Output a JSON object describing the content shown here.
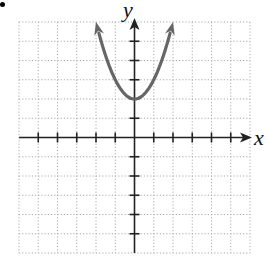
{
  "chart_data": {
    "type": "line",
    "title": "",
    "xlabel": "x",
    "ylabel": "y",
    "xlim": [
      -6,
      6
    ],
    "ylim": [
      -6,
      6
    ],
    "grid": true,
    "grid_style": "dotted",
    "x_ticks": [
      -5,
      -4,
      -3,
      -2,
      -1,
      1,
      2,
      3,
      4,
      5
    ],
    "y_ticks": [
      -5,
      -4,
      -3,
      -2,
      -1,
      1,
      2,
      3,
      4,
      5
    ],
    "tick_labels_shown": false,
    "series": [
      {
        "name": "parabola",
        "equation": "y = x^2 + 2",
        "vertex": [
          0,
          2
        ],
        "x": [
          -2,
          -1.5,
          -1,
          -0.5,
          0,
          0.5,
          1,
          1.5,
          2
        ],
        "y": [
          6,
          4.25,
          3,
          2.25,
          2,
          2.25,
          3,
          4.25,
          6
        ],
        "arrows_both_ends": true,
        "color": "#666666"
      }
    ],
    "legend": null
  },
  "labels": {
    "x_axis": "x",
    "y_axis": "y"
  },
  "colors": {
    "curve": "#666666",
    "axis": "#222222",
    "grid": "#aaaaaa"
  }
}
